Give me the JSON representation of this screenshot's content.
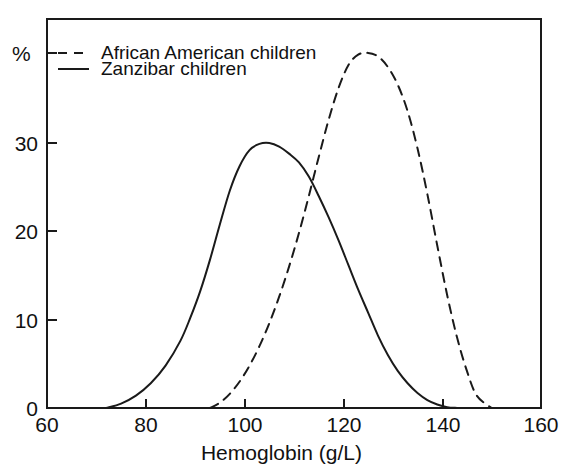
{
  "chart_data": {
    "type": "line",
    "title": "",
    "subtitle": "",
    "xlabel": "Hemoglobin (g/L)",
    "ylabel": "%",
    "xlim": [
      60,
      160
    ],
    "ylim": [
      0,
      42
    ],
    "xticks": [
      60,
      80,
      100,
      120,
      140,
      160
    ],
    "xtick_labels": [
      "60",
      "80",
      "100",
      "120",
      "140",
      "160"
    ],
    "yticks": [
      0,
      10,
      20,
      30,
      40
    ],
    "ytick_labels": [
      "0",
      "10",
      "20",
      "30",
      "%"
    ],
    "grid": false,
    "legend_position": "top-left",
    "series": [
      {
        "name": "African American children",
        "style": "dashed",
        "color": "#1a1a1a",
        "x": [
          93,
          95,
          97,
          99,
          101,
          103,
          105,
          107,
          109,
          111,
          113,
          115,
          117,
          119,
          121,
          123,
          125,
          127,
          129,
          131,
          133,
          135,
          137,
          139,
          141,
          143,
          145,
          147,
          150
        ],
        "y": [
          0,
          0.6,
          1.6,
          3.0,
          4.8,
          7.0,
          9.6,
          12.6,
          16.0,
          19.8,
          24.0,
          28.4,
          32.6,
          36.2,
          38.8,
          40.0,
          40.2,
          39.8,
          38.6,
          36.6,
          33.6,
          29.4,
          24.2,
          18.4,
          12.8,
          8.0,
          4.2,
          1.4,
          0
        ]
      },
      {
        "name": "Zanzibar children",
        "style": "solid",
        "color": "#1a1a1a",
        "x": [
          72,
          75,
          78,
          81,
          84,
          87,
          89,
          91,
          93,
          95,
          97,
          99,
          101,
          103,
          105,
          107,
          109,
          111,
          113,
          115,
          117,
          119,
          121,
          123,
          125,
          127,
          129,
          131,
          133,
          135,
          137,
          139,
          141,
          143
        ],
        "y": [
          0,
          0.5,
          1.4,
          2.8,
          4.8,
          7.6,
          10.2,
          13.2,
          16.8,
          20.8,
          24.6,
          27.4,
          29.2,
          29.9,
          30.0,
          29.6,
          28.8,
          27.8,
          26.2,
          24.0,
          21.6,
          19.0,
          16.2,
          13.4,
          10.8,
          8.2,
          6.0,
          4.2,
          2.8,
          1.7,
          0.9,
          0.4,
          0.1,
          0
        ]
      }
    ]
  },
  "legend": {
    "entries": [
      {
        "label": "African American children",
        "style": "dashed"
      },
      {
        "label": "Zanzibar children",
        "style": "solid"
      }
    ]
  },
  "axis": {
    "x_title": "Hemoglobin (g/L)",
    "y_title": "%",
    "x_tick_0": "60",
    "x_tick_1": "80",
    "x_tick_2": "100",
    "x_tick_3": "120",
    "x_tick_4": "140",
    "x_tick_5": "160",
    "y_tick_0": "0",
    "y_tick_1": "10",
    "y_tick_2": "20",
    "y_tick_3": "30"
  },
  "colors": {
    "line": "#1a1a1a",
    "axis": "#1a1a1a",
    "background": "#ffffff"
  }
}
